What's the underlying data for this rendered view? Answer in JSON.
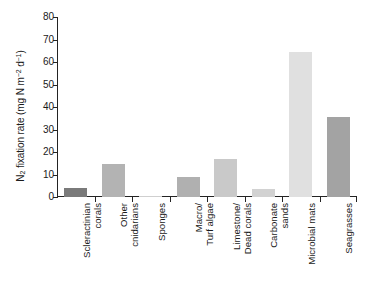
{
  "chart_data": {
    "type": "bar",
    "title": "",
    "subtitle": "",
    "xlabel": "",
    "ylabel": "N2 fixation rate (mg N m-2 d-1)",
    "ylabel_parts": {
      "prefix": "N",
      "sub": "2",
      "middle": " fixation rate (mg N m",
      "sup1": "−2",
      "mid2": " d",
      "sup2": "−1",
      "suffix": ")"
    },
    "categories": [
      "Scleractinian\ncorals",
      "Other\ncnidarians",
      "Sponges",
      "Macro/\nTurf algae",
      "Limestone/\nDead corals",
      "Carbonate\nsands",
      "Microbial mats",
      "Seagrasses"
    ],
    "values": [
      4.2,
      14.8,
      0.5,
      8.8,
      17.0,
      3.4,
      64.5,
      35.5
    ],
    "bar_colors": [
      "#7a7a7a",
      "#b3b3b3",
      "#cfcfcf",
      "#b0b0b0",
      "#c9c9c9",
      "#d2d2d2",
      "#e0e0e0",
      "#a3a3a3"
    ],
    "ylim": [
      0,
      80
    ],
    "yticks": [
      0,
      10,
      20,
      30,
      40,
      50,
      60,
      70,
      80
    ],
    "ytick_labels": [
      "0",
      "10",
      "20",
      "30",
      "40",
      "50",
      "60",
      "70",
      "80"
    ],
    "grid": false,
    "legend": null,
    "axis_color": "#232323",
    "background_color": "#ffffff"
  }
}
